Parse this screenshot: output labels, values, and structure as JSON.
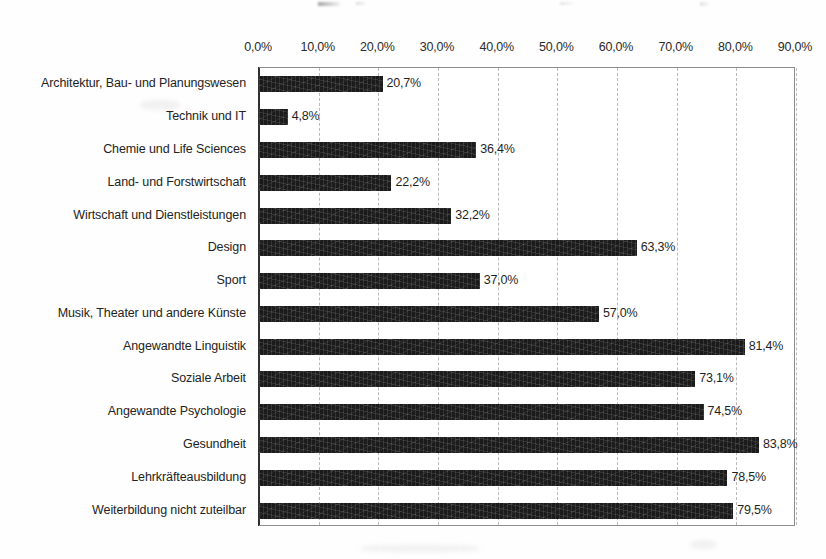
{
  "chart_data": {
    "type": "bar",
    "orientation": "horizontal",
    "title": "",
    "xlabel": "",
    "ylabel": "",
    "xlim": [
      0,
      90
    ],
    "xtick_labels": [
      "0,0%",
      "10,0%",
      "20,0%",
      "30,0%",
      "40,0%",
      "50,0%",
      "60,0%",
      "70,0%",
      "80,0%",
      "90,0%"
    ],
    "xticks": [
      0,
      10,
      20,
      30,
      40,
      50,
      60,
      70,
      80,
      90
    ],
    "grid": true,
    "grid_axis": "x",
    "legend": false,
    "bar_color": "#1b1b1b",
    "categories": [
      "Architektur, Bau- und Planungswesen",
      "Technik und IT",
      "Chemie und Life Sciences",
      "Land- und Forstwirtschaft",
      "Wirtschaft und Dienstleistungen",
      "Design",
      "Sport",
      "Musik, Theater und andere Künste",
      "Angewandte Linguistik",
      "Soziale Arbeit",
      "Angewandte Psychologie",
      "Gesundheit",
      "Lehrkräfteausbildung",
      "Weiterbildung nicht zuteilbar"
    ],
    "values": [
      20.7,
      4.8,
      36.4,
      22.2,
      32.2,
      63.3,
      37.0,
      57.0,
      81.4,
      73.1,
      74.5,
      83.8,
      78.5,
      79.5
    ],
    "data_labels": [
      "20,7%",
      "4,8%",
      "36,4%",
      "22,2%",
      "32,2%",
      "63,3%",
      "37,0%",
      "57,0%",
      "81,4%",
      "73,1%",
      "74,5%",
      "83,8%",
      "78,5%",
      "79,5%"
    ]
  }
}
